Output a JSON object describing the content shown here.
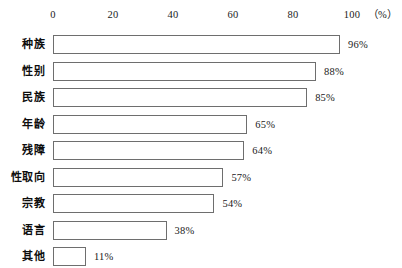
{
  "chart_data": {
    "type": "bar",
    "orientation": "horizontal",
    "title": "",
    "subtitle": "",
    "xlabel": "",
    "ylabel": "",
    "unit_label": "（%）",
    "xlim": [
      0,
      100
    ],
    "grid": false,
    "legend": null,
    "axis": {
      "position": "top",
      "ticks": [
        0,
        20,
        40,
        60,
        80,
        100
      ],
      "tick_labels": [
        "0",
        "20",
        "40",
        "60",
        "80",
        "100"
      ]
    },
    "categories": [
      "种族",
      "性别",
      "民族",
      "年龄",
      "残障",
      "性取向",
      "宗教",
      "语言",
      "其他"
    ],
    "values": [
      96,
      88,
      85,
      65,
      64,
      57,
      54,
      38,
      11
    ],
    "data_labels": [
      "96%",
      "88%",
      "85%",
      "65%",
      "64%",
      "57%",
      "54%",
      "38%",
      "11%"
    ],
    "colors": {
      "bar_fill": "#ffffff",
      "bar_border": "#6e6e6e",
      "text": "#1a1a1a",
      "background": "#ffffff"
    }
  }
}
